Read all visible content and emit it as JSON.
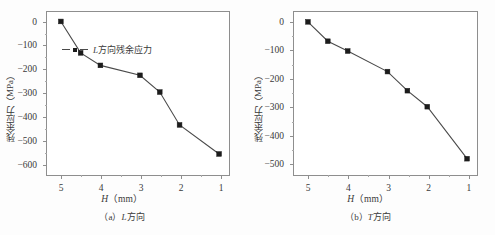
{
  "figure": {
    "background": "#fdfdfd",
    "line_color": "#4a4a4a",
    "marker_color": "#1c1c1c",
    "axis_color": "#8e8e8e"
  },
  "panels": [
    {
      "id": "a",
      "caption": "（a）L方向",
      "caption_prefix": "（a）",
      "caption_italic": "L",
      "caption_suffix": "方向",
      "legend_label": "L方向残余应力",
      "legend_italic": "L",
      "legend_rest": "方向残余应力",
      "ylabel": "残余应力（MPa）",
      "xlabel_italic": "H",
      "xlabel_rest": "（mm）",
      "yticks": [
        "0",
        "-100",
        "-200",
        "-300",
        "-400",
        "-500",
        "-600"
      ],
      "xticks": [
        "5",
        "4",
        "3",
        "2",
        "1"
      ]
    },
    {
      "id": "b",
      "caption": "（b）T方向",
      "caption_prefix": "（b）",
      "caption_italic": "T",
      "caption_suffix": "方向",
      "legend_label": "T方向残余应力",
      "legend_italic": "T",
      "legend_rest": "方向残余应力",
      "ylabel": "残余应力（MPa）",
      "xlabel_italic": "H",
      "xlabel_rest": "（mm）",
      "yticks": [
        "0",
        "-100",
        "-200",
        "-300",
        "-400",
        "-500"
      ],
      "xticks": [
        "5",
        "4",
        "3",
        "2",
        "1"
      ]
    }
  ],
  "chart_data": [
    {
      "type": "line",
      "title": "（a）L方向",
      "series": [
        {
          "name": "L方向残余应力",
          "x": [
            5,
            4.5,
            4,
            3,
            2.5,
            2,
            1
          ],
          "values": [
            0,
            -133,
            -186,
            -228,
            -299,
            -438,
            -561
          ]
        }
      ],
      "xlabel": "H（mm）",
      "ylabel": "残余应力（MPa）",
      "xlim": [
        5.35,
        0.75
      ],
      "ylim": [
        40,
        -650
      ],
      "xticks": [
        5,
        4,
        3,
        2,
        1
      ],
      "yticks": [
        0,
        -100,
        -200,
        -300,
        -400,
        -500,
        -600
      ],
      "grid": false,
      "legend_position": "upper-left",
      "x_axis_reversed": true
    },
    {
      "type": "line",
      "title": "（b）T方向",
      "series": [
        {
          "name": "T方向残余应力",
          "x": [
            5,
            4.5,
            4,
            3,
            2.5,
            2,
            1
          ],
          "values": [
            0,
            -69,
            -104,
            -177,
            -245,
            -302,
            -487
          ]
        }
      ],
      "xlabel": "H（mm）",
      "ylabel": "残余应力（MPa）",
      "xlim": [
        5.35,
        0.75
      ],
      "ylim": [
        35,
        -545
      ],
      "xticks": [
        5,
        4,
        3,
        2,
        1
      ],
      "yticks": [
        0,
        -100,
        -200,
        -300,
        -400,
        -500
      ],
      "grid": false,
      "legend_position": "upper-left",
      "x_axis_reversed": true
    }
  ]
}
